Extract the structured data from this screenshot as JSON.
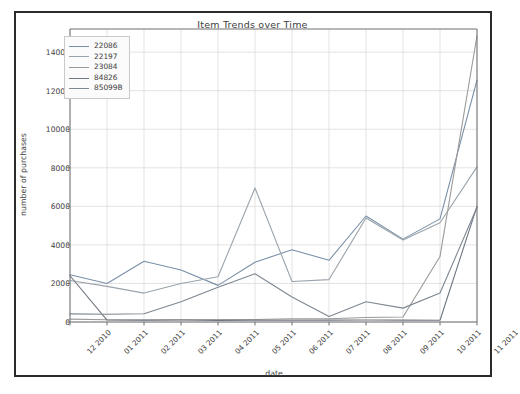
{
  "chart_data": {
    "type": "line",
    "title": "Item Trends over Time",
    "xlabel": "date",
    "ylabel": "number of purchases",
    "grid": true,
    "legend_position": "upper left",
    "categories": [
      "12 2010",
      "01 2011",
      "02 2011",
      "03 2011",
      "04 2011",
      "05 2011",
      "06 2011",
      "07 2011",
      "08 2011",
      "09 2011",
      "10 2011",
      "11 2011"
    ],
    "ylim": [
      0,
      15200
    ],
    "yticks": [
      0,
      2000,
      4000,
      6000,
      8000,
      10000,
      12000,
      14000
    ],
    "ytick_labels": [
      "0",
      "2000",
      "4000",
      "6000",
      "8000",
      "10000",
      "12000",
      "14000"
    ],
    "series": [
      {
        "name": "22086",
        "color": "#7a90a8",
        "values": [
          2450,
          2000,
          3150,
          2700,
          1900,
          3100,
          3750,
          3200,
          5500,
          4300,
          5350,
          12550
        ]
      },
      {
        "name": "22197",
        "color": "#9aa3ab",
        "values": [
          2150,
          1850,
          1500,
          2000,
          2350,
          6950,
          2100,
          2200,
          5400,
          4250,
          5150,
          8050
        ]
      },
      {
        "name": "23084",
        "color": "#9a9a9a",
        "values": [
          150,
          120,
          110,
          120,
          130,
          130,
          160,
          170,
          230,
          260,
          3400,
          14850
        ]
      },
      {
        "name": "84826",
        "color": "#6f7680",
        "values": [
          2400,
          100,
          90,
          100,
          80,
          90,
          90,
          95,
          100,
          95,
          90,
          6000
        ]
      },
      {
        "name": "85099B",
        "color": "#7e8791",
        "values": [
          420,
          400,
          430,
          1050,
          1800,
          2500,
          1300,
          280,
          1050,
          720,
          1500,
          5950
        ]
      }
    ],
    "axes_px": {
      "left": 70,
      "right": 477,
      "top": 29,
      "bottom": 322
    }
  }
}
